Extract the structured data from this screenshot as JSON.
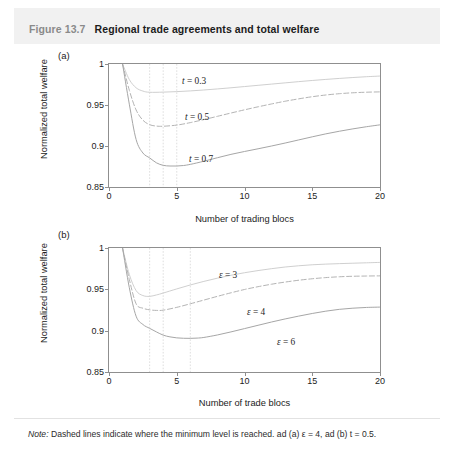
{
  "figure": {
    "number": "Figure 13.7",
    "title": "Regional trade agreements and total welfare",
    "note_lead": "Note:",
    "note_text": " Dashed lines indicate where the minimum level is reached. ad (a) ε = 4, ad (b) t = 0.5."
  },
  "chart_data": [
    {
      "type": "line",
      "panel": "(a)",
      "title": "",
      "xlabel": "Number of trading blocs",
      "ylabel": "Normalized total welfare",
      "xlim": [
        0,
        20
      ],
      "ylim": [
        0.85,
        1
      ],
      "xticks": [
        0,
        5,
        10,
        15,
        20
      ],
      "xtick_labels": [
        "0",
        "5",
        "10",
        "15",
        "20"
      ],
      "yticks": [
        0.85,
        0.9,
        0.95,
        1
      ],
      "ytick_labels": [
        "0.85",
        "0.9",
        "0.95",
        "1"
      ],
      "grid": false,
      "legend_position": "inline-annotations",
      "annotations": [
        {
          "label": "t = 0.3",
          "var": "t",
          "value": "0.3"
        },
        {
          "label": "t = 0.5",
          "var": "t",
          "value": "0.5"
        },
        {
          "label": "t = 0.7",
          "var": "t",
          "value": "0.7"
        }
      ],
      "minimum_markers": [
        3,
        4,
        5
      ],
      "series": [
        {
          "name": "t = 0.3",
          "style": "solid-light",
          "color": "#c9c9c9",
          "x": [
            1,
            1.5,
            2,
            2.5,
            3,
            4,
            5,
            6,
            7,
            8,
            9,
            10,
            11,
            12,
            13,
            14,
            15,
            16,
            17,
            18,
            19,
            20
          ],
          "values": [
            1.0,
            0.981,
            0.971,
            0.967,
            0.9655,
            0.9657,
            0.9663,
            0.9672,
            0.9683,
            0.9696,
            0.971,
            0.9725,
            0.974,
            0.9755,
            0.977,
            0.9785,
            0.9799,
            0.9812,
            0.9824,
            0.9835,
            0.9845,
            0.9853
          ]
        },
        {
          "name": "t = 0.5",
          "style": "dashed",
          "color": "#b4b4b4",
          "x": [
            1,
            1.5,
            2,
            2.5,
            3,
            3.5,
            4,
            5,
            6,
            7,
            8,
            9,
            10,
            11,
            12,
            13,
            14,
            15,
            16,
            17,
            18,
            19,
            20
          ],
          "values": [
            1.0,
            0.968,
            0.944,
            0.9315,
            0.926,
            0.9243,
            0.9241,
            0.9255,
            0.9285,
            0.9322,
            0.9362,
            0.9402,
            0.9441,
            0.9478,
            0.9513,
            0.9546,
            0.9575,
            0.9601,
            0.9622,
            0.9638,
            0.9649,
            0.9656,
            0.966
          ]
        },
        {
          "name": "t = 0.7",
          "style": "solid",
          "color": "#a6a6a6",
          "x": [
            1,
            1.5,
            2,
            2.5,
            3,
            3.5,
            4,
            4.5,
            5,
            5.5,
            6,
            7,
            8,
            9,
            10,
            11,
            12,
            13,
            14,
            15,
            16,
            17,
            18,
            19,
            20
          ],
          "values": [
            1.0,
            0.951,
            0.908,
            0.8915,
            0.8855,
            0.8795,
            0.8764,
            0.8756,
            0.8756,
            0.8762,
            0.8776,
            0.8814,
            0.8857,
            0.8898,
            0.8933,
            0.8966,
            0.9,
            0.9036,
            0.9074,
            0.9112,
            0.9148,
            0.918,
            0.9209,
            0.9235,
            0.9258
          ]
        }
      ]
    },
    {
      "type": "line",
      "panel": "(b)",
      "title": "",
      "xlabel": "Number of trade blocs",
      "ylabel": "Normalized total welfare",
      "xlim": [
        0,
        20
      ],
      "ylim": [
        0.85,
        1
      ],
      "xticks": [
        0,
        5,
        10,
        15,
        20
      ],
      "xtick_labels": [
        "0",
        "5",
        "10",
        "15",
        "20"
      ],
      "yticks": [
        0.85,
        0.9,
        0.95,
        1
      ],
      "ytick_labels": [
        "0.85",
        "0.9",
        "0.95",
        "1"
      ],
      "grid": false,
      "legend_position": "inline-annotations",
      "annotations": [
        {
          "label": "ε = 3",
          "var": "ε",
          "value": "3"
        },
        {
          "label": "ε = 4",
          "var": "ε",
          "value": "4"
        },
        {
          "label": "ε = 6",
          "var": "ε",
          "value": "6"
        }
      ],
      "minimum_markers": [
        3,
        4,
        6
      ],
      "series": [
        {
          "name": "ε = 3",
          "style": "solid-light",
          "color": "#c9c9c9",
          "x": [
            1,
            1.5,
            2,
            2.5,
            3,
            3.5,
            4,
            5,
            6,
            7,
            8,
            9,
            10,
            11,
            12,
            13,
            14,
            15,
            16,
            17,
            18,
            19,
            20
          ],
          "values": [
            1.0,
            0.968,
            0.9485,
            0.9425,
            0.9415,
            0.9432,
            0.9455,
            0.9505,
            0.9553,
            0.9596,
            0.9635,
            0.967,
            0.9701,
            0.9727,
            0.975,
            0.977,
            0.9785,
            0.9797,
            0.9805,
            0.9811,
            0.9816,
            0.9821,
            0.9826
          ]
        },
        {
          "name": "ε = 4",
          "style": "dashed",
          "color": "#b4b4b4",
          "x": [
            1,
            1.5,
            2,
            2.5,
            3,
            3.5,
            4,
            5,
            6,
            7,
            8,
            9,
            10,
            11,
            12,
            13,
            14,
            15,
            16,
            17,
            18,
            19,
            20
          ],
          "values": [
            1.0,
            0.962,
            0.9325,
            0.9272,
            0.9252,
            0.9245,
            0.9248,
            0.9282,
            0.9325,
            0.937,
            0.9415,
            0.9458,
            0.9498,
            0.9532,
            0.9562,
            0.9588,
            0.961,
            0.9628,
            0.9642,
            0.9652,
            0.9658,
            0.9661,
            0.9663
          ]
        },
        {
          "name": "ε = 6",
          "style": "solid",
          "color": "#a6a6a6",
          "x": [
            1,
            1.5,
            2,
            2.5,
            3,
            3.5,
            4,
            4.5,
            5,
            5.5,
            6,
            6.5,
            7,
            8,
            9,
            10,
            11,
            12,
            13,
            14,
            15,
            16,
            17,
            18,
            19,
            20
          ],
          "values": [
            1.0,
            0.952,
            0.9175,
            0.9075,
            0.9028,
            0.8985,
            0.8946,
            0.8925,
            0.8913,
            0.8908,
            0.8907,
            0.891,
            0.8918,
            0.8948,
            0.8985,
            0.9025,
            0.9065,
            0.9105,
            0.9142,
            0.9176,
            0.9208,
            0.9236,
            0.9258,
            0.9272,
            0.9281,
            0.9285
          ]
        }
      ]
    }
  ]
}
